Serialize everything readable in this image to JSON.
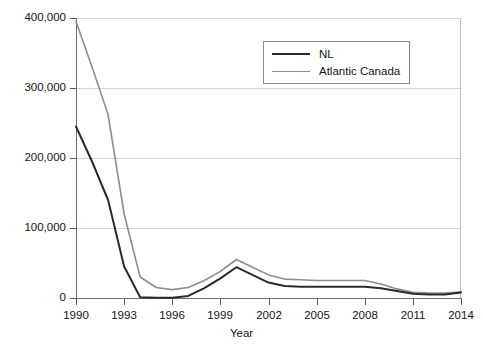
{
  "chart_data": {
    "type": "line",
    "title": "",
    "xlabel": "Year",
    "ylabel": "",
    "x": [
      1990,
      1991,
      1992,
      1993,
      1994,
      1995,
      1996,
      1997,
      1998,
      1999,
      2000,
      2001,
      2002,
      2003,
      2004,
      2005,
      2006,
      2007,
      2008,
      2009,
      2010,
      2011,
      2012,
      2013,
      2014
    ],
    "xlim": [
      1990,
      2014
    ],
    "ylim": [
      0,
      400000
    ],
    "xticks": [
      1990,
      1993,
      1996,
      1999,
      2002,
      2005,
      2008,
      2011,
      2014
    ],
    "xtick_labels": [
      "1990",
      "1993",
      "1996",
      "1999",
      "2002",
      "2005",
      "2008",
      "2011",
      "2014"
    ],
    "yticks": [
      0,
      100000,
      200000,
      300000,
      400000
    ],
    "ytick_labels": [
      "0",
      "100,000",
      "200,000",
      "300,000",
      "400,000"
    ],
    "grid": true,
    "grid_axis": "y",
    "legend_position": "top-right-inside",
    "series": [
      {
        "name": "NL",
        "color": "#2b2b2b",
        "line_width": 2,
        "values": [
          245000,
          195000,
          140000,
          45000,
          1000,
          500,
          500,
          3000,
          14000,
          28000,
          44000,
          33000,
          22000,
          17000,
          16000,
          16000,
          16000,
          16000,
          16000,
          14000,
          10000,
          6000,
          5000,
          5000,
          8000
        ]
      },
      {
        "name": "Atlantic Canada",
        "color": "#8d8d8d",
        "line_width": 1.6,
        "values": [
          395000,
          330000,
          262000,
          120000,
          30000,
          15000,
          12000,
          15000,
          25000,
          38000,
          55000,
          44000,
          33000,
          27000,
          26000,
          25000,
          25000,
          25000,
          25000,
          20000,
          13000,
          8000,
          7000,
          7000,
          9000
        ]
      }
    ]
  },
  "legend": {
    "items": [
      {
        "label": "NL"
      },
      {
        "label": "Atlantic Canada"
      }
    ]
  }
}
